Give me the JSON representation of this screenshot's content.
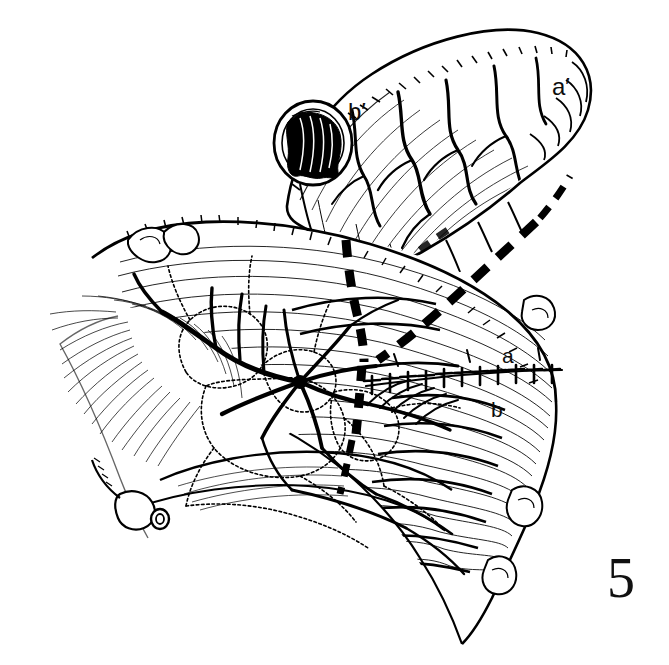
{
  "figure": {
    "number": "5",
    "kind": "line-drawing",
    "medium": "pen-and-ink surgical illustration",
    "background_color": "#ffffff",
    "ink_color": "#000000",
    "width_px": 669,
    "height_px": 665
  },
  "labels": [
    {
      "id": "a-prime",
      "text": "a′",
      "x": 562,
      "y": 88,
      "font_size_px": 24,
      "target": "distal end of mobilized bowel segment"
    },
    {
      "id": "b-prime",
      "text": "b′",
      "x": 358,
      "y": 113,
      "font_size_px": 24,
      "target": "open cut lumen of mobilized bowel segment"
    },
    {
      "id": "a",
      "text": "a",
      "x": 508,
      "y": 356,
      "font_size_px": 21,
      "target": "proximal bowel limb above anastomosis"
    },
    {
      "id": "b",
      "text": "b",
      "x": 497,
      "y": 410,
      "font_size_px": 21,
      "target": "distal bowel limb below anastomosis"
    }
  ],
  "structures": {
    "upper_segment": {
      "name": "mobilized bowel / jejunal segment",
      "description": "Tubular bowel loop directed up and to the right, its cut proximal end open toward the lower left showing mucosal folds; serosal surface rendered with fine longitudinal hatching and branching subserosal vessels.",
      "open_lumen": {
        "name": "cut-end lumen",
        "center_x": 313,
        "center_y": 143,
        "radius_px": 39,
        "fill": "solid black mucosal folds"
      }
    },
    "lower_segment": {
      "name": "bowel in continuity with mesentery",
      "description": "Larger bowel loop crossing the lower two-thirds of the field, drawn with dense curved hatching, with appendices epiploicae / fatty tags along its right border."
    },
    "mesentery": {
      "name": "mesenteric fan",
      "description": "Translucent mesenteric leaf fanning to the left and below, drawn in fine radiating strokes, carrying the vascular arcade."
    },
    "vascular_arcade": {
      "name": "mesenteric vascular arcade",
      "artery_style": "solid black branching lines",
      "vein_style": "stippled / beaded double outline",
      "hub_x": 300,
      "hub_y": 382,
      "description": "Arterial and venous arcades converge at a central vascular hub beneath the bowel, sending vasa recta to both limbs; a divided vessel stump with an open cut end is seen at the lower left."
    },
    "divided_vessel_stump": {
      "name": "divided vessel stump",
      "x": 162,
      "y": 519,
      "description": "Transected vessel shown end-on as a small open circle at the lower-left border of the mesentery."
    }
  },
  "annotations": {
    "resection_line": {
      "name": "dashed resection / division line",
      "style": "heavy black dashes",
      "shape": "inverted V converging to a point, then descending",
      "description": "Marks the planned line of division of the mesentery and bowel wall; the two limbs descend from the upper bowel border and meet near the vascular hub before continuing inferiorly."
    },
    "suture_line": {
      "name": "interrupted suture line (anastomosis)",
      "style": "row of small T-shaped stitch marks",
      "x_start": 368,
      "x_end": 566,
      "y": 383,
      "description": "Completed end-to-end anastomosis between limb a (above) and limb b (below), depicted as a row of interrupted seromuscular stitches."
    }
  },
  "legend_text": {
    "a_prime": "a′",
    "b_prime": "b′",
    "a": "a",
    "b": "b",
    "figure_number": "5"
  }
}
